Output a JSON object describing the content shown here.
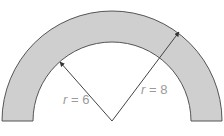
{
  "diagram": {
    "type": "semicircular annulus",
    "inner_radius_label": {
      "var": "r",
      "eq": " = ",
      "value": "6"
    },
    "outer_radius_label": {
      "var": "r",
      "eq": " = ",
      "value": "8"
    },
    "colors": {
      "fill": "#cfcfcf",
      "stroke": "#555555",
      "line": "#444444",
      "label": "#9a9a9a"
    }
  }
}
